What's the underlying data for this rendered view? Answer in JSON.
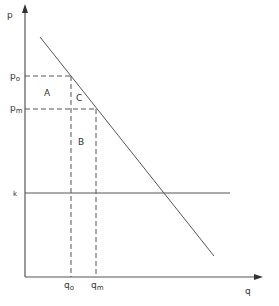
{
  "diagram": {
    "type": "economics-monopoly-price-quantity",
    "axes": {
      "y_label": "p",
      "x_label": "q"
    },
    "price_labels": {
      "p0": {
        "main": "p",
        "sub": "o"
      },
      "pm": {
        "main": "p",
        "sub": "m"
      }
    },
    "quantity_labels": {
      "q0": {
        "main": "q",
        "sub": "o"
      },
      "qm": {
        "main": "q",
        "sub": "m"
      }
    },
    "cost_line_label": "k",
    "regions": {
      "A": "A",
      "B": "B",
      "C": "C"
    },
    "colors": {
      "line": "#555555",
      "text": "#333333",
      "background": "#ffffff"
    }
  }
}
